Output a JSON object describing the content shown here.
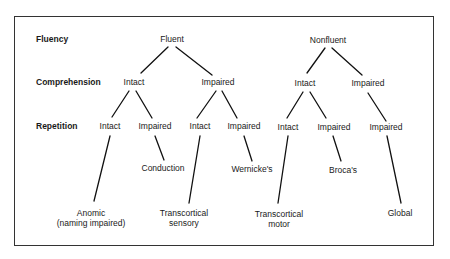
{
  "diagram": {
    "type": "decision-tree",
    "rows": [
      {
        "id": "fluency",
        "label": "Fluency",
        "y": 39
      },
      {
        "id": "comprehension",
        "label": "Comprehension",
        "y": 82
      },
      {
        "id": "repetition",
        "label": "Repetition",
        "y": 126
      }
    ],
    "nodes": {
      "fluent": {
        "label": "Fluent"
      },
      "nonfluent": {
        "label": "Nonfluent"
      },
      "f_comp_intact": {
        "label": "Intact"
      },
      "f_comp_impaired": {
        "label": "Impaired"
      },
      "n_comp_intact": {
        "label": "Intact"
      },
      "n_comp_impaired": {
        "label": "Impaired"
      },
      "f_ci_rep_intact": {
        "label": "Intact"
      },
      "f_ci_rep_impaired": {
        "label": "Impaired"
      },
      "f_cm_rep_intact": {
        "label": "Intact"
      },
      "f_cm_rep_impaired": {
        "label": "Impaired"
      },
      "n_ci_rep_intact": {
        "label": "Intact"
      },
      "n_ci_rep_impaired": {
        "label": "Impaired"
      },
      "n_cm_rep_impaired": {
        "label": "Impaired"
      },
      "conduction": {
        "label": "Conduction"
      },
      "wernickes": {
        "label": "Wernicke's"
      },
      "brocas": {
        "label": "Broca's"
      },
      "anomic": {
        "label": "Anomic",
        "sublabel": "(naming impaired)"
      },
      "tc_sensory": {
        "label": "Transcortical",
        "sublabel": "sensory"
      },
      "tc_motor": {
        "label": "Transcortical",
        "sublabel": "motor"
      },
      "global": {
        "label": "Global"
      }
    },
    "edges": [
      [
        "fluent",
        "f_comp_intact"
      ],
      [
        "fluent",
        "f_comp_impaired"
      ],
      [
        "nonfluent",
        "n_comp_intact"
      ],
      [
        "nonfluent",
        "n_comp_impaired"
      ],
      [
        "f_comp_intact",
        "f_ci_rep_intact"
      ],
      [
        "f_comp_intact",
        "f_ci_rep_impaired"
      ],
      [
        "f_comp_impaired",
        "f_cm_rep_intact"
      ],
      [
        "f_comp_impaired",
        "f_cm_rep_impaired"
      ],
      [
        "n_comp_intact",
        "n_ci_rep_intact"
      ],
      [
        "n_comp_intact",
        "n_ci_rep_impaired"
      ],
      [
        "n_comp_impaired",
        "n_cm_rep_impaired"
      ],
      [
        "f_ci_rep_intact",
        "anomic"
      ],
      [
        "f_ci_rep_impaired",
        "conduction"
      ],
      [
        "f_cm_rep_intact",
        "tc_sensory"
      ],
      [
        "f_cm_rep_impaired",
        "wernickes"
      ],
      [
        "n_ci_rep_intact",
        "tc_motor"
      ],
      [
        "n_ci_rep_impaired",
        "brocas"
      ],
      [
        "n_cm_rep_impaired",
        "global"
      ]
    ]
  }
}
